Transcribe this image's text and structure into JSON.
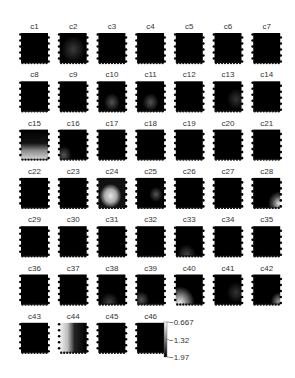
{
  "chart_data": {
    "type": "heatmap",
    "title": "",
    "layout": {
      "columns": 7,
      "rows": 7
    },
    "colormap": "gray",
    "colorbar": {
      "ticks": [
        -0.667,
        -1.32,
        -1.97
      ],
      "tick_labels": [
        "-0.667",
        "-1.32",
        "-1.97"
      ],
      "range": [
        -1.97,
        -0.667
      ]
    },
    "panels": [
      {
        "label": "c1",
        "pattern": "dark"
      },
      {
        "label": "c2",
        "pattern": "faint-center"
      },
      {
        "label": "c3",
        "pattern": "dark"
      },
      {
        "label": "c4",
        "pattern": "dark"
      },
      {
        "label": "c5",
        "pattern": "dark"
      },
      {
        "label": "c6",
        "pattern": "dark"
      },
      {
        "label": "c7",
        "pattern": "dark"
      },
      {
        "label": "c8",
        "pattern": "dark"
      },
      {
        "label": "c9",
        "pattern": "dark"
      },
      {
        "label": "c10",
        "pattern": "faint-lower-center"
      },
      {
        "label": "c11",
        "pattern": "faint-lower-center"
      },
      {
        "label": "c12",
        "pattern": "dark"
      },
      {
        "label": "c13",
        "pattern": "faint-right"
      },
      {
        "label": "c14",
        "pattern": "dark"
      },
      {
        "label": "c15",
        "pattern": "bright-bottom"
      },
      {
        "label": "c16",
        "pattern": "faint-bottom-left"
      },
      {
        "label": "c17",
        "pattern": "dark"
      },
      {
        "label": "c18",
        "pattern": "dark"
      },
      {
        "label": "c19",
        "pattern": "dark"
      },
      {
        "label": "c20",
        "pattern": "dark"
      },
      {
        "label": "c21",
        "pattern": "dark"
      },
      {
        "label": "c22",
        "pattern": "dark"
      },
      {
        "label": "c23",
        "pattern": "dark"
      },
      {
        "label": "c24",
        "pattern": "bright-blob-lower"
      },
      {
        "label": "c25",
        "pattern": "faint-center-right"
      },
      {
        "label": "c26",
        "pattern": "dark"
      },
      {
        "label": "c27",
        "pattern": "dark"
      },
      {
        "label": "c28",
        "pattern": "bright-bottom-right"
      },
      {
        "label": "c29",
        "pattern": "dark"
      },
      {
        "label": "c30",
        "pattern": "dark"
      },
      {
        "label": "c31",
        "pattern": "dark"
      },
      {
        "label": "c32",
        "pattern": "dark"
      },
      {
        "label": "c33",
        "pattern": "faint-bottom"
      },
      {
        "label": "c34",
        "pattern": "dark"
      },
      {
        "label": "c35",
        "pattern": "dark"
      },
      {
        "label": "c36",
        "pattern": "dark"
      },
      {
        "label": "c37",
        "pattern": "dark"
      },
      {
        "label": "c38",
        "pattern": "faint-bottom"
      },
      {
        "label": "c39",
        "pattern": "faint-bottom-left"
      },
      {
        "label": "c40",
        "pattern": "bright-bottom-left"
      },
      {
        "label": "c41",
        "pattern": "faint-right"
      },
      {
        "label": "c42",
        "pattern": "faint-bottom-right"
      },
      {
        "label": "c43",
        "pattern": "dark"
      },
      {
        "label": "c44",
        "pattern": "bright-left"
      },
      {
        "label": "c45",
        "pattern": "dark"
      },
      {
        "label": "c46",
        "pattern": "dark"
      }
    ]
  }
}
